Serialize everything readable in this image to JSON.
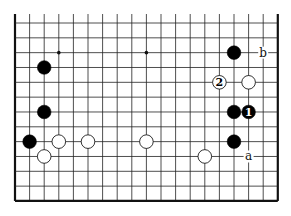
{
  "diagram": {
    "type": "go-board-fragment",
    "grid": {
      "columns": 19,
      "rows": 13,
      "x0": 15,
      "dx": 14.6,
      "y0": 23,
      "dy": 14.83,
      "top_y": 14,
      "edges": {
        "left": true,
        "right": true,
        "bottom": true,
        "top": false
      }
    },
    "star_points": [
      {
        "col": 3,
        "row": 3
      },
      {
        "col": 9,
        "row": 3
      }
    ],
    "stones": [
      {
        "color": "black",
        "col": 2,
        "row": 4,
        "label": ""
      },
      {
        "color": "black",
        "col": 2,
        "row": 7,
        "label": ""
      },
      {
        "color": "black",
        "col": 1,
        "row": 9,
        "label": ""
      },
      {
        "color": "black",
        "col": 15,
        "row": 3,
        "label": ""
      },
      {
        "color": "black",
        "col": 15,
        "row": 7,
        "label": ""
      },
      {
        "color": "black",
        "col": 15,
        "row": 9,
        "label": ""
      },
      {
        "color": "black",
        "col": 16,
        "row": 7,
        "label": "1"
      },
      {
        "color": "white",
        "col": 3,
        "row": 9,
        "label": ""
      },
      {
        "color": "white",
        "col": 5,
        "row": 9,
        "label": ""
      },
      {
        "color": "white",
        "col": 9,
        "row": 9,
        "label": ""
      },
      {
        "color": "white",
        "col": 2,
        "row": 10,
        "label": ""
      },
      {
        "color": "white",
        "col": 13,
        "row": 10,
        "label": ""
      },
      {
        "color": "white",
        "col": 16,
        "row": 5,
        "label": ""
      },
      {
        "color": "white",
        "col": 14,
        "row": 5,
        "label": "2"
      }
    ],
    "point_labels": [
      {
        "col": 17,
        "row": 3,
        "text": "b"
      },
      {
        "col": 16,
        "row": 10,
        "text": "a"
      }
    ],
    "colors": {
      "line": "#222222",
      "edge": "#111111",
      "black_stone": "#000000",
      "white_stone": "#ffffff",
      "background": "#ffffff"
    }
  }
}
